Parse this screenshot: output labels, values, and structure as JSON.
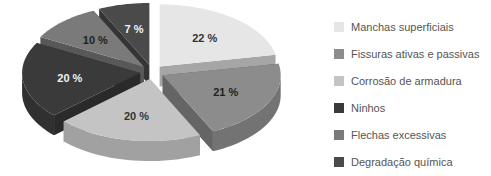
{
  "chart_data": {
    "type": "pie",
    "style": "3d-exploded",
    "title": "",
    "categories": [
      "Manchas superficiais",
      "Fissuras ativas e passivas",
      "Corrosão de armadura",
      "Ninhos",
      "Flechas excessivas",
      "Degradação química"
    ],
    "values": [
      22,
      21,
      20,
      20,
      10,
      7
    ],
    "labels": [
      "22 %",
      "21 %",
      "20 %",
      "20 %",
      "10 %",
      "7 %"
    ],
    "colors": [
      "#e6e6e6",
      "#8c8c8c",
      "#c4c4c4",
      "#3a3a3a",
      "#7a7a7a",
      "#4a4a4a"
    ],
    "label_colors": [
      "#333333",
      "#222222",
      "#333333",
      "#f2f2f2",
      "#222222",
      "#f2f2f2"
    ],
    "legend_position": "right"
  },
  "legend": {
    "items": [
      {
        "label": "Manchas superficiais",
        "color": "#e6e6e6"
      },
      {
        "label": "Fissuras ativas e passivas",
        "color": "#8c8c8c"
      },
      {
        "label": "Corrosão de armadura",
        "color": "#c4c4c4"
      },
      {
        "label": "Ninhos",
        "color": "#3a3a3a"
      },
      {
        "label": "Flechas excessivas",
        "color": "#7a7a7a"
      },
      {
        "label": "Degradação química",
        "color": "#4a4a4a"
      }
    ]
  }
}
